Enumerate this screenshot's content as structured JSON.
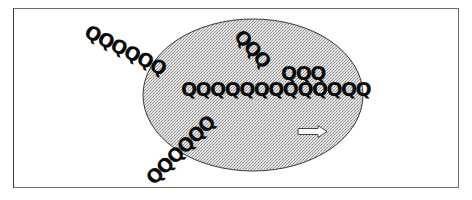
{
  "diagram": {
    "frame": {
      "border_color": "#6e6e6e",
      "background": "#ffffff"
    },
    "ellipse": {
      "fill_color": "#c8c8c8",
      "stroke_color": "#3a3a3a",
      "pattern": "stipple"
    },
    "q_strings": [
      {
        "id": "upper-left-diagonal",
        "text": "QQQQQQ",
        "rotation_deg": 27
      },
      {
        "id": "horizontal-row",
        "text": "QQQQQQQQQQQQQ",
        "rotation_deg": 0
      },
      {
        "id": "top-diagonal",
        "text": "QQQ",
        "rotation_deg": 48
      },
      {
        "id": "top-row",
        "text": "QQQ",
        "rotation_deg": 0
      },
      {
        "id": "lower-left-diagonal",
        "text": "QQQQQQ",
        "rotation_deg": -45
      }
    ],
    "arrow": {
      "direction": "right",
      "style": "hollow",
      "stroke_color": "#444444"
    }
  }
}
